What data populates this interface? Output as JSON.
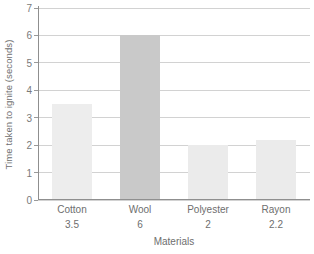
{
  "chart_data": {
    "type": "bar",
    "title": "",
    "subtitle": "",
    "xlabel": "Materials",
    "ylabel": "Time taken to ignite (seconds)",
    "categories": [
      "Cotton",
      "Wool",
      "Polyester",
      "Rayon"
    ],
    "values": [
      3.5,
      6,
      2,
      2.2
    ],
    "value_labels": [
      "3.5",
      "6",
      "2",
      "2.2"
    ],
    "ylim": [
      0,
      7
    ],
    "ytick_labels": [
      "0",
      "1",
      "2",
      "3",
      "4",
      "5",
      "6",
      "7"
    ],
    "ytick_values": [
      0,
      1,
      2,
      3,
      4,
      5,
      6,
      7
    ],
    "grid": "horizontal",
    "legend": "none",
    "bar_colors": [
      "#ededed",
      "#c9c9c9",
      "#ebebeb",
      "#ebebeb"
    ],
    "series": [
      {
        "name": "Time taken to ignite (seconds)",
        "values": [
          3.5,
          6,
          2,
          2.2
        ]
      }
    ]
  },
  "style": {
    "axis_color": "#8f8f8f",
    "grid_color": "#d2d2d2",
    "text_color": "#6e6e6e",
    "tick_text_color": "#7a7a7a",
    "background": "#ffffff"
  }
}
